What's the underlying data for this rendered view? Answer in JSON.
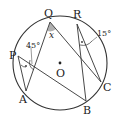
{
  "diagram": {
    "type": "circle-inscribed-angles",
    "center_label": "O",
    "points": [
      {
        "label": "Q"
      },
      {
        "label": "R"
      },
      {
        "label": "P"
      },
      {
        "label": "A"
      },
      {
        "label": "B"
      },
      {
        "label": "C"
      }
    ],
    "segments": [
      "QA",
      "QC",
      "PA",
      "PB",
      "RB",
      "RC"
    ],
    "angles": [
      {
        "at": "Q",
        "label": "x"
      },
      {
        "label": "45°"
      },
      {
        "label": "15°"
      }
    ],
    "colors": {
      "stroke": "#333333",
      "shade": "#b0b0b0"
    }
  }
}
